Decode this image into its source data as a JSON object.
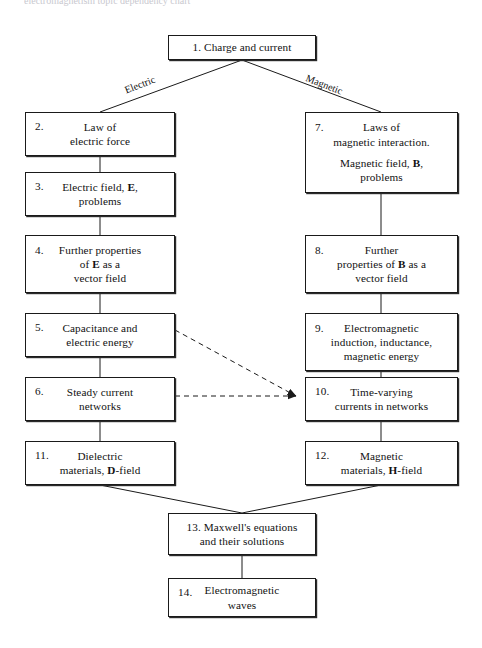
{
  "figure": {
    "type": "flowchart",
    "title_fragment": "electromagnetism topic dependency chart",
    "background_color": "#ffffff",
    "line_color": "#1a1a1a"
  },
  "nodes": [
    {
      "id": "node-1",
      "number": "1.",
      "lines": [
        "1. Charge and current"
      ],
      "inline_number": true,
      "x": 168,
      "y": 35,
      "w": 148,
      "h": 25
    },
    {
      "id": "node-2",
      "number": "2.",
      "lines": [
        "Law of",
        "electric force"
      ],
      "x": 25,
      "y": 112,
      "w": 150,
      "h": 44
    },
    {
      "id": "node-3",
      "number": "3.",
      "lines": [
        "Electric field, E,",
        "problems"
      ],
      "bold_tokens": [
        "E"
      ],
      "x": 25,
      "y": 172,
      "w": 150,
      "h": 44
    },
    {
      "id": "node-4",
      "number": "4.",
      "lines": [
        "Further properties",
        "of E as a",
        "vector field"
      ],
      "bold_tokens": [
        "E"
      ],
      "x": 25,
      "y": 235,
      "w": 150,
      "h": 58
    },
    {
      "id": "node-5",
      "number": "5.",
      "lines": [
        "Capacitance and",
        "electric energy"
      ],
      "x": 25,
      "y": 313,
      "w": 150,
      "h": 44
    },
    {
      "id": "node-6",
      "number": "6.",
      "lines": [
        "Steady current",
        "networks"
      ],
      "x": 25,
      "y": 377,
      "w": 150,
      "h": 44
    },
    {
      "id": "node-11",
      "number": "11.",
      "lines": [
        "Dielectric",
        "materials, D-field"
      ],
      "bold_tokens": [
        "D"
      ],
      "x": 25,
      "y": 441,
      "w": 150,
      "h": 44
    },
    {
      "id": "node-7",
      "number": "7.",
      "lines": [
        "Laws of",
        "magnetic interaction.",
        "Magnetic field, B,",
        "problems"
      ],
      "bold_tokens": [
        "B"
      ],
      "gap_before_line": 2,
      "x": 305,
      "y": 112,
      "w": 153,
      "h": 81
    },
    {
      "id": "node-8",
      "number": "8.",
      "lines": [
        "Further",
        "properties of B as a",
        "vector field"
      ],
      "bold_tokens": [
        "B"
      ],
      "x": 305,
      "y": 235,
      "w": 153,
      "h": 58
    },
    {
      "id": "node-9",
      "number": "9.",
      "lines": [
        "Electromagnetic",
        "induction, inductance,",
        "magnetic energy"
      ],
      "x": 305,
      "y": 313,
      "w": 153,
      "h": 58
    },
    {
      "id": "node-10",
      "number": "10.",
      "lines": [
        "Time-varying",
        "currents in networks"
      ],
      "x": 305,
      "y": 377,
      "w": 153,
      "h": 44
    },
    {
      "id": "node-12",
      "number": "12.",
      "lines": [
        "Magnetic",
        "materials, H-field"
      ],
      "bold_tokens": [
        "H"
      ],
      "x": 305,
      "y": 441,
      "w": 153,
      "h": 44
    },
    {
      "id": "node-13",
      "number": "13.",
      "lines": [
        "13. Maxwell's equations",
        "and their solutions"
      ],
      "inline_number": true,
      "x": 168,
      "y": 513,
      "w": 148,
      "h": 42
    },
    {
      "id": "node-14",
      "number": "14.",
      "lines": [
        "Electromagnetic",
        "waves"
      ],
      "x": 168,
      "y": 578,
      "w": 148,
      "h": 39
    }
  ],
  "edge_labels": [
    {
      "id": "label-electric",
      "text": "Electric",
      "x": 124,
      "y": 79,
      "rotate": -21
    },
    {
      "id": "label-magnetic",
      "text": "Magnetic",
      "x": 305,
      "y": 79,
      "rotate": 21
    }
  ],
  "edges": [
    {
      "id": "edge-1-2",
      "from": "node-1",
      "to": "node-2",
      "style": "solid",
      "arrow": false
    },
    {
      "id": "edge-1-7",
      "from": "node-1",
      "to": "node-7",
      "style": "solid",
      "arrow": false
    },
    {
      "id": "edge-2-3",
      "from": "node-2",
      "to": "node-3",
      "style": "solid",
      "arrow": false
    },
    {
      "id": "edge-3-4",
      "from": "node-3",
      "to": "node-4",
      "style": "solid",
      "arrow": false
    },
    {
      "id": "edge-4-5",
      "from": "node-4",
      "to": "node-5",
      "style": "solid",
      "arrow": false
    },
    {
      "id": "edge-5-6",
      "from": "node-5",
      "to": "node-6",
      "style": "solid",
      "arrow": false
    },
    {
      "id": "edge-6-11",
      "from": "node-6",
      "to": "node-11",
      "style": "solid",
      "arrow": false
    },
    {
      "id": "edge-7-8",
      "from": "node-7",
      "to": "node-8",
      "style": "solid",
      "arrow": false
    },
    {
      "id": "edge-8-9",
      "from": "node-8",
      "to": "node-9",
      "style": "solid",
      "arrow": false
    },
    {
      "id": "edge-9-10",
      "from": "node-9",
      "to": "node-10",
      "style": "solid",
      "arrow": false
    },
    {
      "id": "edge-10-12",
      "from": "node-10",
      "to": "node-12",
      "style": "solid",
      "arrow": false
    },
    {
      "id": "edge-5-10",
      "from": "node-5",
      "to": "node-10",
      "style": "dashed",
      "arrow": true
    },
    {
      "id": "edge-6-10",
      "from": "node-6",
      "to": "node-10",
      "style": "dashed",
      "arrow": true
    },
    {
      "id": "edge-11-13",
      "from": "node-11",
      "to": "node-13",
      "style": "solid",
      "arrow": false
    },
    {
      "id": "edge-12-13",
      "from": "node-12",
      "to": "node-13",
      "style": "solid",
      "arrow": false
    },
    {
      "id": "edge-13-14",
      "from": "node-13",
      "to": "node-14",
      "style": "solid",
      "arrow": false
    }
  ]
}
